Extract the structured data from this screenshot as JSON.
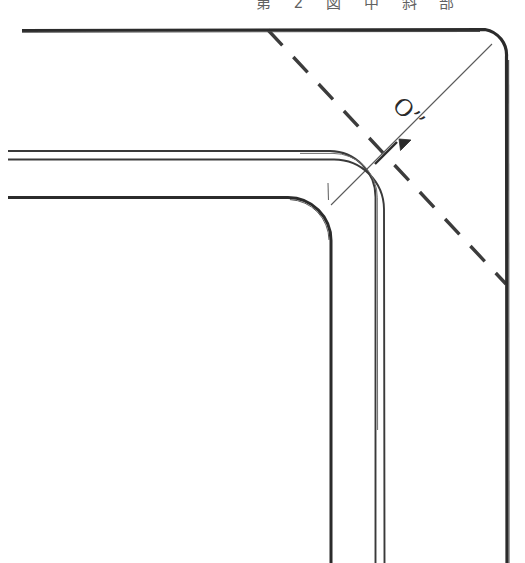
{
  "figure": {
    "background_color": "#ffffff",
    "ink_color": "#2b2b2b",
    "faint_ink_color": "#555555",
    "width": 525,
    "height": 563
  },
  "caption": {
    "text": "第 2 図 中 斜 部",
    "note": "partially cropped CJK caption row along very top edge"
  },
  "labels": {
    "origin_prime": "O’’",
    "origin_prime_x": 392,
    "origin_prime_y": 100
  },
  "geometry": {
    "outer_profile": {
      "name": "outer-plate-edge",
      "stroke_width": 3.2,
      "color": "#2b2b2b",
      "top_line_start_x": 22,
      "top_line_y": 30,
      "arc_start_x": 486,
      "arc_end_x": 507,
      "arc_end_y": 58,
      "corner_radius": 26,
      "right_line_end_y": 563
    },
    "middle_profile": {
      "name": "inner-double-edge",
      "stroke_width": 2.0,
      "color": "#3a3a3a",
      "line_a_y": 151,
      "line_b_y": 159,
      "left_x": 8,
      "corner_radius_a": 48,
      "corner_radius_b": 48,
      "vertical_a_x": 375,
      "vertical_b_x": 384,
      "bottom_y": 563
    },
    "inner_profile": {
      "name": "inner-plate-edge",
      "stroke_width": 3.0,
      "color": "#2b2b2b",
      "line_y": 197,
      "left_x": 8,
      "corner_radius": 44,
      "vertical_x": 331,
      "bottom_y": 563
    },
    "dashed_centerline": {
      "name": "dashed-diagonal",
      "stroke_width": 3.4,
      "dash_pattern": "20 16",
      "color": "#3c3c3c",
      "start_x": 268,
      "start_y": 30,
      "end_x": 506,
      "end_y": 284
    },
    "thin_radial_line": {
      "name": "radius-construction-line",
      "stroke_width": 1.0,
      "color": "#5a5a5a",
      "start_x": 331,
      "start_y": 205,
      "end_x": 492,
      "end_y": 44
    },
    "arrowhead": {
      "name": "radius-arrowhead",
      "tip_x": 399,
      "tip_y": 139,
      "angle_deg": 225,
      "length": 15
    },
    "tick_mark": {
      "name": "cross-tick",
      "center_x": 386,
      "center_y": 153,
      "half_length": 15,
      "angle_deg": 135
    },
    "short_tick_vertical": {
      "name": "short-vertical-tick",
      "x": 328,
      "y_top": 183,
      "y_bottom": 200
    }
  }
}
